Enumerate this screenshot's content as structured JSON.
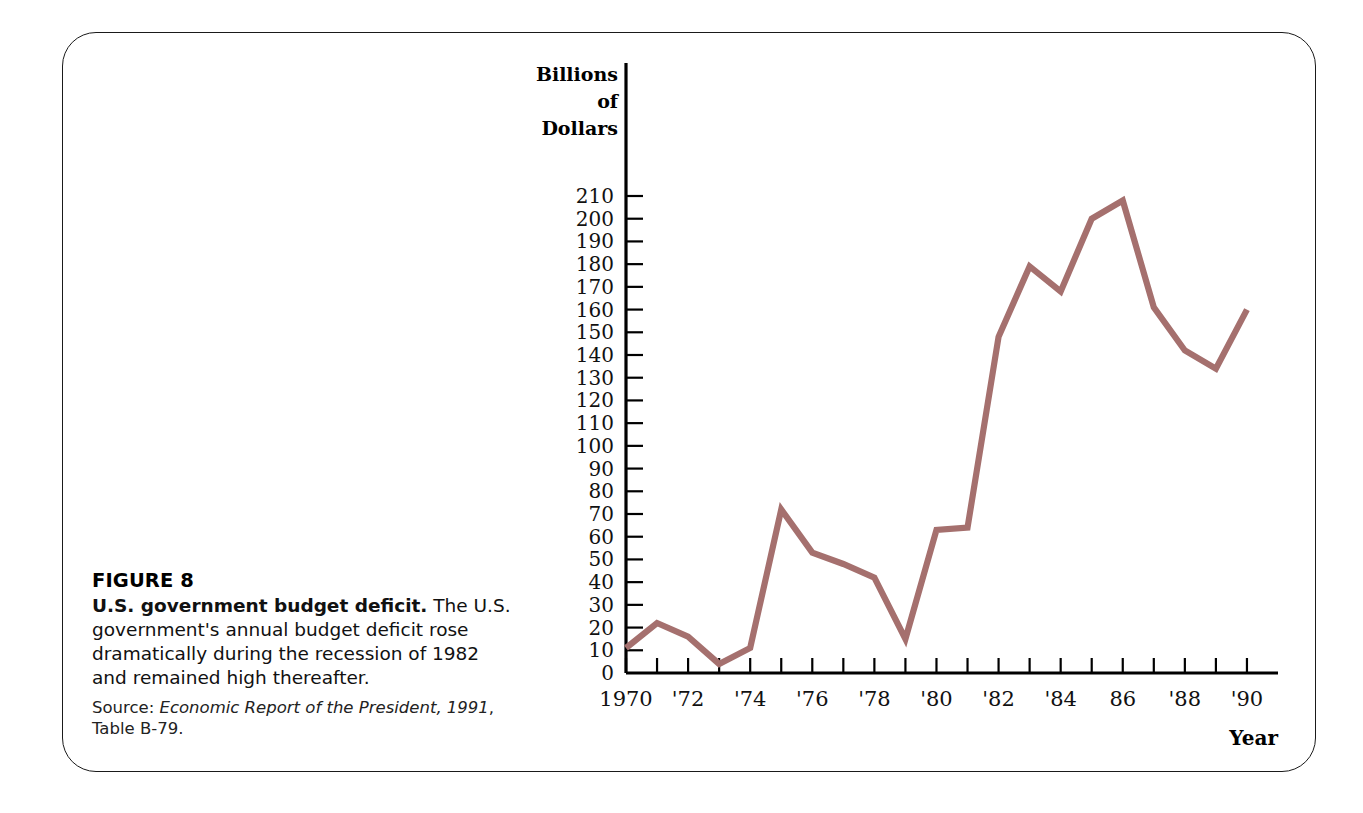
{
  "figure": {
    "number_label": "FIGURE 8",
    "title_lead": "U.S. government budget deficit.",
    "description": " The U.S. government's annual budget deficit rose dramatically during the recession of 1982 and remained high thereafter.",
    "source_prefix": "Source: ",
    "source_italic": "Economic Report of the President, 1991",
    "source_suffix": ", Table B-79."
  },
  "chart_data": {
    "type": "line",
    "title": "",
    "subtitle": "",
    "xlabel": "Year",
    "ylabel": "Billions of Dollars",
    "ylabel_lines": [
      "Billions",
      "of",
      "Dollars"
    ],
    "grid": false,
    "legend": "none",
    "xlim": [
      1970,
      1991
    ],
    "ylim": [
      0,
      215
    ],
    "ytick_values": [
      0,
      10,
      20,
      30,
      40,
      50,
      60,
      70,
      80,
      90,
      100,
      110,
      120,
      130,
      140,
      150,
      160,
      170,
      180,
      190,
      200,
      210
    ],
    "ytick_labels": [
      "0",
      "10",
      "20",
      "30",
      "40",
      "50",
      "60",
      "70",
      "80",
      "90",
      "100",
      "110",
      "120",
      "130",
      "140",
      "150",
      "160",
      "170",
      "180",
      "190",
      "200",
      "210"
    ],
    "xtick_values": [
      1970,
      1971,
      1972,
      1973,
      1974,
      1975,
      1976,
      1977,
      1978,
      1979,
      1980,
      1981,
      1982,
      1983,
      1984,
      1985,
      1986,
      1987,
      1988,
      1989,
      1990
    ],
    "xtick_labeled": [
      {
        "x": 1970,
        "label": "1970"
      },
      {
        "x": 1972,
        "label": "'72"
      },
      {
        "x": 1974,
        "label": "'74"
      },
      {
        "x": 1976,
        "label": "'76"
      },
      {
        "x": 1978,
        "label": "'78"
      },
      {
        "x": 1980,
        "label": "'80"
      },
      {
        "x": 1982,
        "label": "'82"
      },
      {
        "x": 1984,
        "label": "'84"
      },
      {
        "x": 1986,
        "label": "86"
      },
      {
        "x": 1988,
        "label": "'88"
      },
      {
        "x": 1990,
        "label": "'90"
      }
    ],
    "series": [
      {
        "name": "U.S. federal budget deficit",
        "color": "#a5706e",
        "x": [
          1970,
          1971,
          1972,
          1973,
          1974,
          1975,
          1976,
          1977,
          1978,
          1979,
          1980,
          1981,
          1982,
          1983,
          1984,
          1985,
          1986,
          1987,
          1988,
          1989,
          1990
        ],
        "values": [
          11,
          22,
          16,
          4,
          11,
          72,
          53,
          48,
          42,
          15,
          63,
          64,
          148,
          179,
          168,
          200,
          208,
          161,
          142,
          134,
          160
        ]
      }
    ]
  }
}
